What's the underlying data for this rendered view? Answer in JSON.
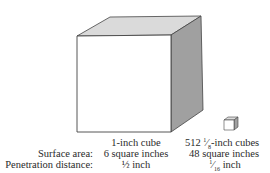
{
  "figure": {
    "large_cube": {
      "label": "1-inch cube",
      "surface_area": "6 square inches",
      "penetration_distance": "½ inch"
    },
    "small_cubes": {
      "count": "512",
      "size_num": "1",
      "size_den": "8",
      "label_rest": "-inch cubes",
      "surface_area": "48 square inches",
      "pen_num": "1",
      "pen_den": "16",
      "pen_rest": " inch"
    },
    "row_labels": {
      "surface_area": "Surface area:",
      "penetration_distance": "Penetration distance:"
    },
    "colors": {
      "front_face": "#ffffff",
      "top_face": "#d9d9d9",
      "side_face": "#9e9e9e",
      "edge": "#444444"
    }
  }
}
